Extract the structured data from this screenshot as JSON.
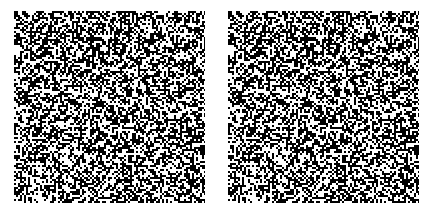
{
  "figure": {
    "type": "random-dot stereogram pair",
    "background_color": "#ffffff",
    "dot_colors": {
      "on": "#000000",
      "off": "#ffffff"
    },
    "panels": [
      {
        "id": "left",
        "label": "",
        "x": 14,
        "y": 11,
        "width": 191,
        "height": 192,
        "seed": 1337
      },
      {
        "id": "right",
        "label": "",
        "x": 228,
        "y": 11,
        "width": 191,
        "height": 192,
        "seed": 1337
      }
    ],
    "dot_size_px": 2,
    "density": 0.5,
    "disparity_px": 6,
    "hidden_region": {
      "x": 48,
      "y": 48,
      "width": 96,
      "height": 96
    }
  }
}
